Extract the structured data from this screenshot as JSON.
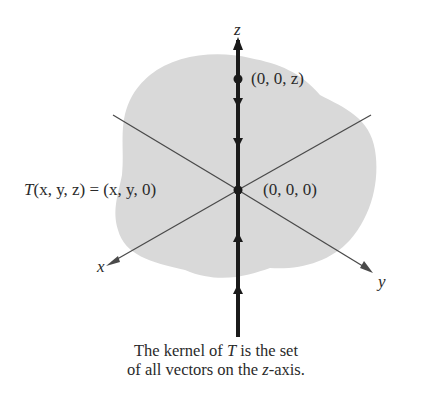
{
  "figure": {
    "plane_color": "#d9d9d9",
    "axis_color": "#4a4a4a",
    "z_axis_color": "#1a1a1a",
    "axes": {
      "z_label": "z",
      "x_label": "x",
      "y_label": "y"
    },
    "points": {
      "upper_point_label": "(0, 0, z)",
      "origin_label": "(0, 0, 0)"
    },
    "transformation": {
      "lhs_T": "T",
      "lhs_args": "(x, y, z)",
      "equals": "=",
      "rhs": "(x, y, 0)"
    }
  },
  "caption": {
    "line1_prefix": "The kernel of ",
    "line1_T": "T",
    "line1_suffix": " is the set",
    "line2_prefix": "of all vectors on the ",
    "line2_z": "z",
    "line2_suffix": "-axis."
  }
}
